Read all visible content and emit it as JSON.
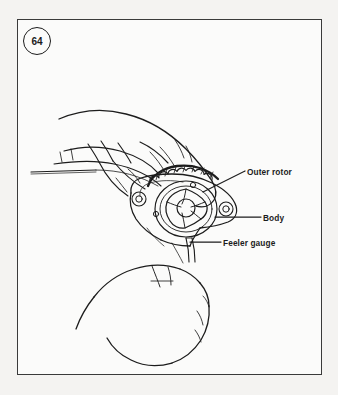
{
  "figure": {
    "number": "64",
    "badge_name": "figure-number-badge"
  },
  "callouts": [
    {
      "id": "outer-rotor",
      "label": "Outer rotor"
    },
    {
      "id": "body",
      "label": "Body"
    },
    {
      "id": "feeler-gauge",
      "label": "Feeler gauge"
    }
  ],
  "colors": {
    "page_background": "#f4f3f1",
    "frame_background": "#fbfbfa",
    "line": "#1c1c1c",
    "frame_border": "#3a3a3a"
  },
  "illustration": {
    "description": "Line drawing of two hands measuring oil pump rotor clearance with a feeler gauge",
    "parts": [
      "upper-hand-holding-feeler-gauge",
      "lower-hand-gripping-pump",
      "oil-pump-body",
      "outer-rotor-with-lobed-teeth",
      "inner-star-rotor",
      "feeler-gauge-blade"
    ]
  }
}
